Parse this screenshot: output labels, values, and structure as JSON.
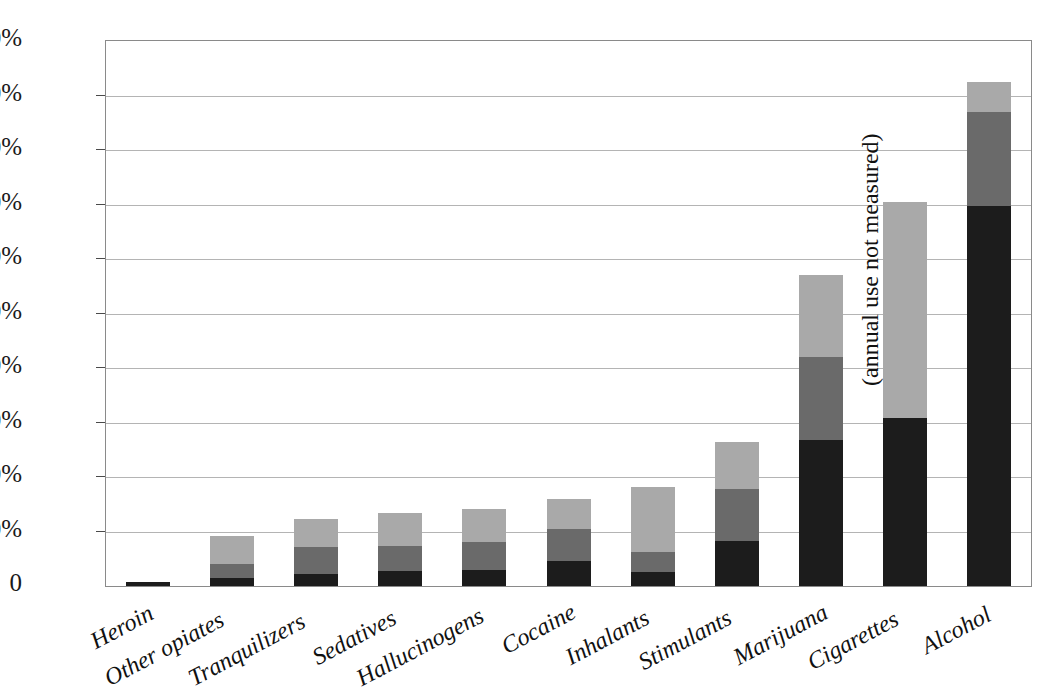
{
  "chart_data": {
    "type": "bar",
    "stacked": true,
    "title": "",
    "subtitle": "",
    "xlabel": "",
    "ylabel": "",
    "ylim": [
      0,
      100
    ],
    "yticks": [
      0,
      10,
      20,
      30,
      40,
      50,
      60,
      70,
      80,
      90,
      100
    ],
    "ytick_labels": [
      "0",
      "10%",
      "20%",
      "30%",
      "40%",
      "50%",
      "60%",
      "70%",
      "80%",
      "90%",
      "100%"
    ],
    "grid": true,
    "legend_position": "none",
    "categories": [
      "Heroin",
      "Other opiates",
      "Tranquilizers",
      "Sedatives",
      "Hallucinogens",
      "Cocaine",
      "Inhalants",
      "Stimulants",
      "Marijuana",
      "Cigarettes",
      "Alcohol"
    ],
    "series": [
      {
        "name": "30-day use",
        "color": "#1c1c1c",
        "values": [
          0.8,
          1.5,
          2.2,
          2.8,
          2.9,
          4.5,
          2.5,
          8.2,
          26.8,
          30.8,
          69.7
        ]
      },
      {
        "name": "Annual use",
        "color": "#6a6a6a",
        "values": [
          0.0,
          4.0,
          7.1,
          7.3,
          8.0,
          10.5,
          6.2,
          17.8,
          42.0,
          null,
          87.0
        ]
      },
      {
        "name": "Lifetime use",
        "color": "#a9a9a9",
        "values": [
          0.8,
          9.2,
          12.3,
          13.4,
          14.2,
          16.0,
          18.2,
          26.4,
          57.0,
          70.5,
          92.5
        ]
      }
    ],
    "cumulative_tops": {
      "Heroin": {
        "dark": 0.8,
        "mid": null,
        "light": 0.8
      },
      "Other opiates": {
        "dark": 1.5,
        "mid": 4.0,
        "light": 9.2
      },
      "Tranquilizers": {
        "dark": 2.2,
        "mid": 7.1,
        "light": 12.3
      },
      "Sedatives": {
        "dark": 2.8,
        "mid": 7.3,
        "light": 13.4
      },
      "Hallucinogens": {
        "dark": 2.9,
        "mid": 8.0,
        "light": 14.2
      },
      "Cocaine": {
        "dark": 4.5,
        "mid": 10.5,
        "light": 16.0
      },
      "Inhalants": {
        "dark": 2.5,
        "mid": 6.2,
        "light": 18.2
      },
      "Stimulants": {
        "dark": 8.2,
        "mid": 17.8,
        "light": 26.4
      },
      "Marijuana": {
        "dark": 26.8,
        "mid": 42.0,
        "light": 57.0
      },
      "Cigarettes": {
        "dark": 30.8,
        "mid": null,
        "light": 70.5
      },
      "Alcohol": {
        "dark": 69.7,
        "mid": 87.0,
        "light": 92.5
      }
    },
    "annotations": [
      {
        "text": "(annual use not measured)",
        "attached_to": "Cigarettes",
        "orientation": "vertical"
      }
    ]
  },
  "colors": {
    "dark_segment": "#1c1c1c",
    "mid_segment": "#6a6a6a",
    "light_segment": "#a9a9a9",
    "gridline": "#b4b4b4",
    "axis": "#8a8a8a",
    "text": "#111111",
    "background": "#ffffff"
  }
}
